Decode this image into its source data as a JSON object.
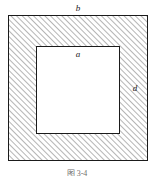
{
  "figure": {
    "type": "technical-drawing",
    "caption": "图 3-4",
    "caption_truncated": true,
    "background_color": "#ffffff",
    "outline_color": "#1b1b1b",
    "hatch_color": "#5a5a5a",
    "inner_fill_color": "#ffffff",
    "outer_square": {
      "name": "outer-square",
      "x": 8,
      "y": 15,
      "width": 140,
      "height": 146,
      "stroke_width": 1
    },
    "inner_square": {
      "name": "inner-square",
      "x": 36,
      "y": 46,
      "width": 84,
      "height": 88,
      "stroke_width": 1
    },
    "hatch": {
      "angle_degrees": 45,
      "direction": "lower-left to upper-right",
      "spacing_px": 4,
      "line_width": 0.9
    },
    "labels": [
      {
        "id": "b",
        "text": "b",
        "x": 78,
        "y": 8,
        "style": "italic",
        "meaning": "outer square side dimension"
      },
      {
        "id": "a",
        "text": "a",
        "x": 78,
        "y": 54,
        "style": "italic",
        "meaning": "inner square side dimension"
      },
      {
        "id": "d",
        "text": "d",
        "x": 135,
        "y": 88,
        "style": "italic",
        "meaning": "hatched wall thickness"
      }
    ]
  }
}
